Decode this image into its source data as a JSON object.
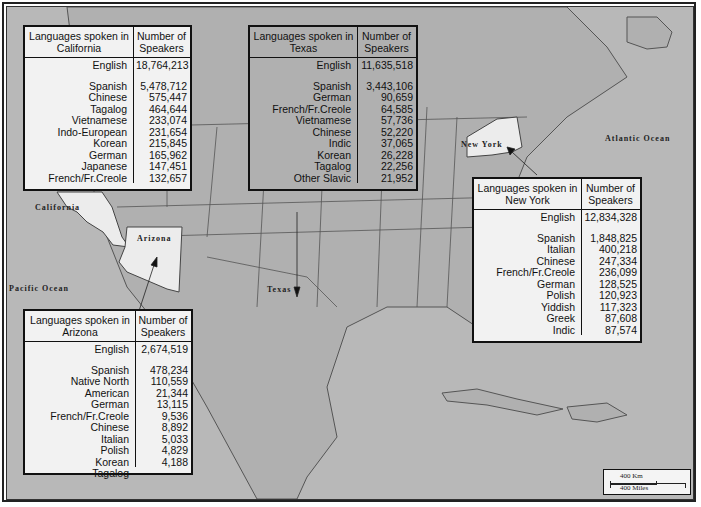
{
  "map": {
    "labels": {
      "california": "California",
      "arizona": "Arizona",
      "texas": "Texas",
      "new_york": "New York",
      "pacific_ocean": "Pacific Ocean",
      "atlantic_ocean": "Atlantic Ocean"
    },
    "scale": {
      "km": "400 Km",
      "miles": "400 Miles"
    },
    "colors": {
      "land": "#b4b4b4",
      "highlight_state": "#ececec",
      "table_bg": "#f2f2f2",
      "border": "#111111"
    }
  },
  "tables": {
    "california": {
      "header_lang": "Languages spoken in California",
      "header_num": "Number of Speakers",
      "english": {
        "lang": "English",
        "num": "18,764,213"
      },
      "rows": [
        {
          "lang": "Spanish",
          "num": "5,478,712"
        },
        {
          "lang": "Chinese",
          "num": "575,447"
        },
        {
          "lang": "Tagalog",
          "num": "464,644"
        },
        {
          "lang": "Vietnamese",
          "num": "233,074"
        },
        {
          "lang": "Indo-European",
          "num": "231,654"
        },
        {
          "lang": "Korean",
          "num": "215,845"
        },
        {
          "lang": "German",
          "num": "165,962"
        },
        {
          "lang": "Japanese",
          "num": "147,451"
        },
        {
          "lang": "French/Fr.Creole",
          "num": "132,657"
        }
      ]
    },
    "texas": {
      "header_lang": "Languages spoken in Texas",
      "header_num": "Number of Speakers",
      "english": {
        "lang": "English",
        "num": "11,635,518"
      },
      "rows": [
        {
          "lang": "Spanish",
          "num": "3,443,106"
        },
        {
          "lang": "German",
          "num": "90,659"
        },
        {
          "lang": "French/Fr.Creole",
          "num": "64,585"
        },
        {
          "lang": "Vietnamese",
          "num": "57,736"
        },
        {
          "lang": "Chinese",
          "num": "52,220"
        },
        {
          "lang": "Indic",
          "num": "37,065"
        },
        {
          "lang": "Korean",
          "num": "26,228"
        },
        {
          "lang": "Tagalog",
          "num": "22,256"
        },
        {
          "lang": "Other Slavic",
          "num": "21,952"
        }
      ]
    },
    "new_york": {
      "header_lang": "Languages spoken in New York",
      "header_num": "Number of Speakers",
      "english": {
        "lang": "English",
        "num": "12,834,328"
      },
      "rows": [
        {
          "lang": "Spanish",
          "num": "1,848,825"
        },
        {
          "lang": "Italian",
          "num": "400,218"
        },
        {
          "lang": "Chinese",
          "num": "247,334"
        },
        {
          "lang": "French/Fr.Creole",
          "num": "236,099"
        },
        {
          "lang": "German",
          "num": "128,525"
        },
        {
          "lang": "Polish",
          "num": "120,923"
        },
        {
          "lang": "Yiddish",
          "num": "117,323"
        },
        {
          "lang": "Greek",
          "num": "87,608"
        },
        {
          "lang": "Indic",
          "num": "87,574"
        }
      ]
    },
    "arizona": {
      "header_lang": "Languages spoken in Arizona",
      "header_num": "Number of Speakers",
      "english": {
        "lang": "English",
        "num": "2,674,519"
      },
      "rows": [
        {
          "lang": "Spanish",
          "num": "478,234"
        },
        {
          "lang": "Native North American",
          "num": "110,559"
        },
        {
          "lang": "German",
          "num": "21,344"
        },
        {
          "lang": "French/Fr.Creole",
          "num": "13,115"
        },
        {
          "lang": "Chinese",
          "num": "9,536"
        },
        {
          "lang": "Italian",
          "num": "8,892"
        },
        {
          "lang": "Polish",
          "num": "5,033"
        },
        {
          "lang": "Korean",
          "num": "4,829"
        },
        {
          "lang": "Tagalog",
          "num": "4,188"
        }
      ]
    }
  }
}
